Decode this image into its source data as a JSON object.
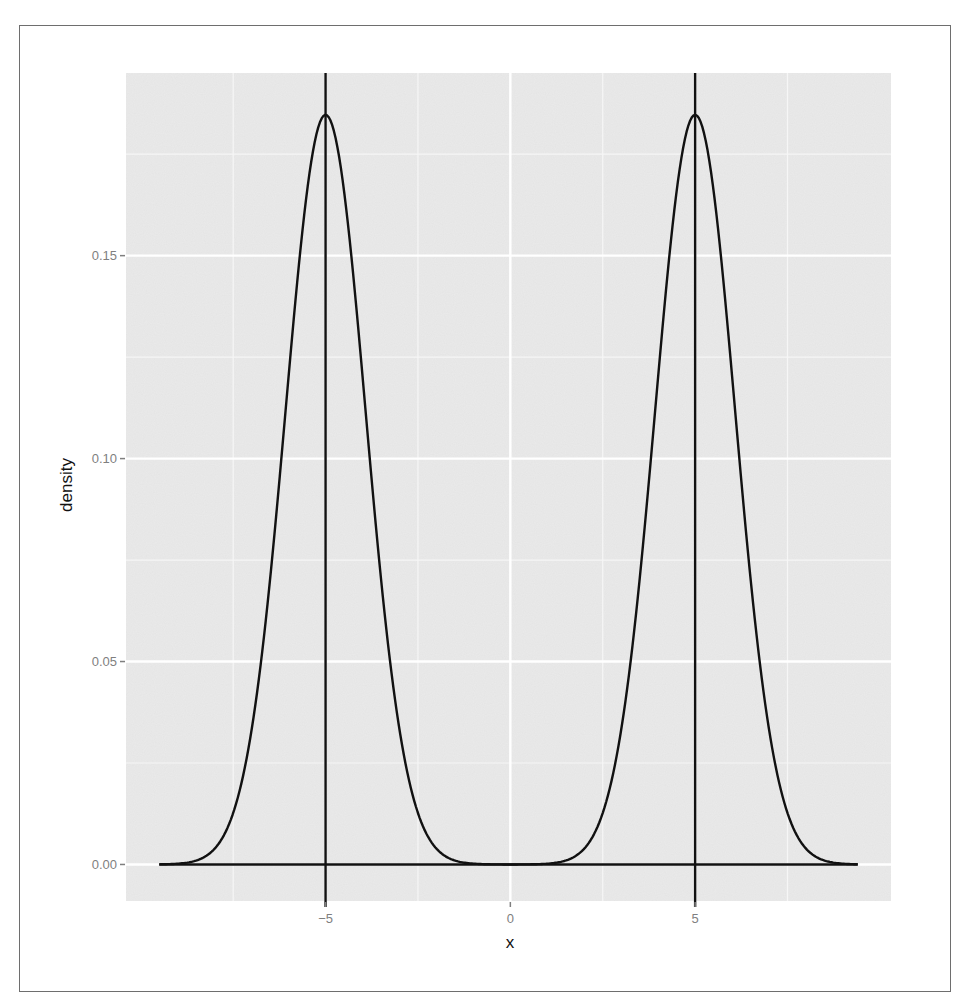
{
  "chart_data": {
    "type": "line",
    "title": "",
    "xlabel": "x",
    "ylabel": "density",
    "xlim": [
      -10.4,
      10.3
    ],
    "ylim": [
      -0.009,
      0.195
    ],
    "grid": true,
    "legend": null,
    "x_ticks": [
      -5,
      0,
      5
    ],
    "x_tick_labels": [
      "-5",
      "0",
      "5"
    ],
    "y_ticks": [
      0.0,
      0.05,
      0.1,
      0.15
    ],
    "y_tick_labels": [
      "0.00",
      "0.05",
      "0.10",
      "0.15"
    ],
    "series": [
      {
        "name": "density",
        "description": "Bimodal density: equal mixture of two normals centered at -5 and 5",
        "components": [
          {
            "mean": -5,
            "sd": 1.08,
            "weight": 0.5
          },
          {
            "mean": 5,
            "sd": 1.08,
            "weight": 0.5
          }
        ],
        "x_range": [
          -9.5,
          9.4
        ],
        "x": [
          -9.5,
          -9,
          -8,
          -7,
          -6.5,
          -6,
          -5.5,
          -5,
          -4.5,
          -4,
          -3.5,
          -3,
          -2,
          -1,
          0,
          1,
          2,
          3,
          3.5,
          4,
          4.5,
          5,
          5.5,
          6,
          6.5,
          7,
          8,
          9,
          9.4
        ],
        "y": [
          0.0,
          0.0002,
          0.0039,
          0.0333,
          0.0704,
          0.1203,
          0.166,
          0.1847,
          0.166,
          0.1203,
          0.0704,
          0.0333,
          0.0039,
          0.0002,
          0.0,
          0.0002,
          0.0039,
          0.0333,
          0.0704,
          0.1203,
          0.166,
          0.1847,
          0.166,
          0.1203,
          0.0704,
          0.0333,
          0.0039,
          0.0002,
          0.0
        ]
      }
    ],
    "vlines": [
      -5,
      5
    ],
    "peak_value": 0.185
  }
}
